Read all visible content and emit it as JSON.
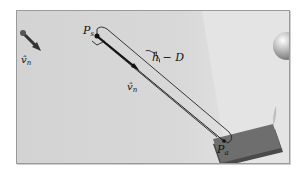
{
  "figure": {
    "labels": {
      "ps": "P",
      "ps_sub": "s",
      "pa": "P",
      "pa_sub": "a",
      "vn_left": "v̂",
      "vn_left_sub": "n",
      "vn_mid": "v̂",
      "vn_mid_sub": "n",
      "hd": "h − D"
    },
    "colors": {
      "background_light": "#e2e2e2",
      "background_dark": "#cbcbcb",
      "plate": "#6e6e6e",
      "plate_edge": "#4a4a4a",
      "line": "#222222"
    }
  }
}
